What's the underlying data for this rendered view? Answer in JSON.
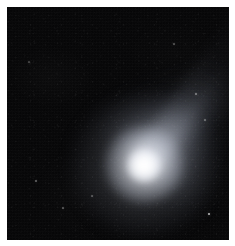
{
  "image": {
    "kind": "astronomical-photograph",
    "subject": "comet",
    "width_px": 235,
    "height_px": 246,
    "background_color": "#ffffff",
    "plate": {
      "left_px": 7,
      "top_px": 7,
      "width_px": 222,
      "height_px": 233,
      "sky_color": "#050506"
    },
    "features": {
      "nucleus": {
        "name": "comet-nucleus",
        "center_x_px": 144,
        "center_y_px": 165,
        "core_color": "#ffffff"
      },
      "coma": {
        "name": "comet-coma",
        "center_x_px": 144,
        "center_y_px": 165,
        "diameter_px": 148,
        "halo_color": "#e6eaf2"
      },
      "tail": {
        "name": "comet-dust-tail",
        "direction": "upper-left",
        "angle_deg": 135,
        "length_px": 200,
        "color": "#d2d8e6"
      },
      "stars": [
        {
          "name": "field-star-1",
          "x_px": 209,
          "y_px": 214,
          "size_px": 2.0,
          "brightness": 0.75
        },
        {
          "name": "field-star-2",
          "x_px": 196,
          "y_px": 94,
          "size_px": 1.4,
          "brightness": 0.4
        },
        {
          "name": "field-star-3",
          "x_px": 36,
          "y_px": 181,
          "size_px": 1.3,
          "brightness": 0.35
        },
        {
          "name": "field-star-4",
          "x_px": 63,
          "y_px": 208,
          "size_px": 1.2,
          "brightness": 0.3
        },
        {
          "name": "field-star-5",
          "x_px": 174,
          "y_px": 44,
          "size_px": 1.2,
          "brightness": 0.28
        },
        {
          "name": "field-star-6",
          "x_px": 205,
          "y_px": 120,
          "size_px": 1.3,
          "brightness": 0.32
        },
        {
          "name": "field-star-7",
          "x_px": 92,
          "y_px": 196,
          "size_px": 1.1,
          "brightness": 0.26
        },
        {
          "name": "field-star-8",
          "x_px": 29,
          "y_px": 62,
          "size_px": 1.1,
          "brightness": 0.24
        }
      ]
    }
  }
}
